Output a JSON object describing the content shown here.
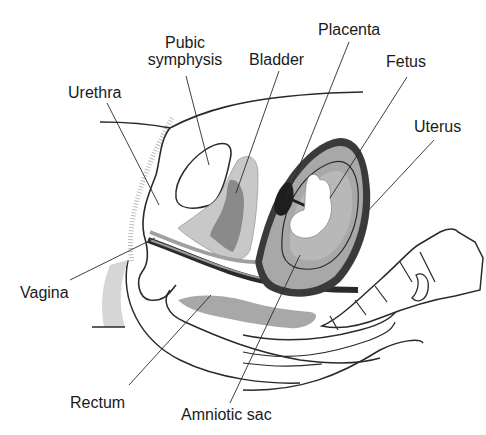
{
  "diagram": {
    "type": "anatomical sagittal section",
    "labels": [
      {
        "id": "pubic-symphysis",
        "text": "Pubic\nsymphysis",
        "line1": "Pubic",
        "line2": "symphysis"
      },
      {
        "id": "bladder",
        "text": "Bladder"
      },
      {
        "id": "placenta",
        "text": "Placenta"
      },
      {
        "id": "fetus",
        "text": "Fetus"
      },
      {
        "id": "urethra",
        "text": "Urethra"
      },
      {
        "id": "uterus",
        "text": "Uterus"
      },
      {
        "id": "vagina",
        "text": "Vagina"
      },
      {
        "id": "rectum",
        "text": "Rectum"
      },
      {
        "id": "amniotic-sac",
        "text": "Amniotic sac"
      }
    ],
    "colors": {
      "line": "#2a2a2a",
      "light_fill": "#c8c8c8",
      "mid_fill": "#a8a8a8",
      "dark_fill": "#7a7a7a",
      "uterus_wall": "#3a3a3a"
    }
  }
}
